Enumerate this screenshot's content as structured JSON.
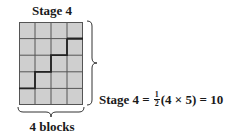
{
  "title": "Stage 4",
  "grid": {
    "columns": 4,
    "rows": 5,
    "fill_color": "#cfcfcf",
    "line_color": "#555555",
    "staircase_color": "#222222"
  },
  "bottom_label": "4 blocks",
  "equation": {
    "lhs": "Stage 4 =",
    "fraction_numerator": "1",
    "fraction_denominator": "2",
    "rhs": "(4 × 5) = 10"
  }
}
